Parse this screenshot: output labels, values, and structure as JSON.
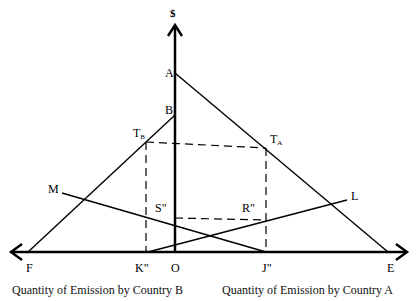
{
  "diagram": {
    "y_axis_label": "$",
    "points": {
      "A": "A",
      "B": "B",
      "TB_main": "T",
      "TB_sub": "B",
      "TA_main": "T",
      "TA_sub": "A",
      "M": "M",
      "L": "L",
      "S": "S\"",
      "R": "R\"",
      "F": "F",
      "K": "K\"",
      "O": "O",
      "J": "J\"",
      "E": "E"
    },
    "captions": {
      "left": "Quantity of Emission by Country B",
      "right": "Quantity of Emission by Country A"
    },
    "colors": {
      "line": "#000000",
      "background": "#ffffff"
    }
  }
}
